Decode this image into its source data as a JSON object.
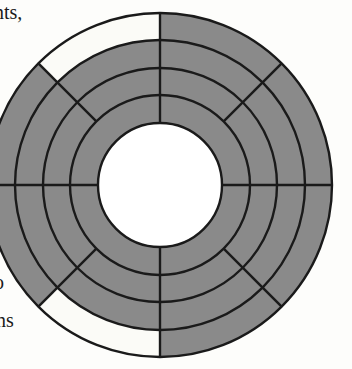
{
  "figure": {
    "name": "radial-sector-diagram",
    "canvas": {
      "width": 352,
      "height": 369
    },
    "colors": {
      "fill_gray": "#8a8a8a",
      "fill_empty": "#fbfbf7",
      "stroke": "#1a1a1a",
      "page_background": "#fdfdfb",
      "text": "#1a1a1a"
    },
    "geometry": {
      "center_x": 160,
      "center_y": 185,
      "outer_radius": 172,
      "hub_radius": 62,
      "ring_count": 4,
      "ring_radii": [
        62,
        90,
        117,
        145,
        172
      ],
      "stroke_width": 2.4,
      "spoke_angles_deg": [
        0,
        45,
        90,
        135,
        180,
        225,
        270,
        315
      ],
      "full_spoke_angles_deg": [
        0,
        90,
        180,
        270
      ],
      "outer_spoke_angles_deg": [
        45,
        135,
        225,
        315
      ]
    },
    "sectors": [
      {
        "id": "r4-s90-135",
        "ring": 4,
        "start_deg": 90,
        "end_deg": 135,
        "filled": false,
        "label": "outer upper-left"
      },
      {
        "id": "r4-s135-180",
        "ring": 4,
        "start_deg": 135,
        "end_deg": 180,
        "filled": true,
        "label": "outer left-upper"
      },
      {
        "id": "r4-s180-225",
        "ring": 4,
        "start_deg": 180,
        "end_deg": 225,
        "filled": true,
        "label": "outer left-lower"
      },
      {
        "id": "r4-s225-270",
        "ring": 4,
        "start_deg": 225,
        "end_deg": 270,
        "filled": false,
        "label": "outer lower-left"
      },
      {
        "id": "r4-s270-315",
        "ring": 4,
        "start_deg": 270,
        "end_deg": 315,
        "filled": true,
        "label": "outer lower-right"
      },
      {
        "id": "r4-s315-360",
        "ring": 4,
        "start_deg": 315,
        "end_deg": 360,
        "filled": true,
        "label": "outer right-lower"
      },
      {
        "id": "r4-s0-45",
        "ring": 4,
        "start_deg": 0,
        "end_deg": 45,
        "filled": true,
        "label": "outer right-upper"
      },
      {
        "id": "r4-s45-90",
        "ring": 4,
        "start_deg": 45,
        "end_deg": 90,
        "filled": true,
        "label": "outer upper-right"
      },
      {
        "id": "r3-all",
        "ring": 3,
        "start_deg": 0,
        "end_deg": 360,
        "filled": true,
        "label": "third ring"
      },
      {
        "id": "r2-all",
        "ring": 2,
        "start_deg": 0,
        "end_deg": 360,
        "filled": true,
        "label": "second ring"
      },
      {
        "id": "r1-all",
        "ring": 1,
        "start_deg": 0,
        "end_deg": 360,
        "filled": true,
        "label": "inner ring"
      },
      {
        "id": "hub",
        "ring": 0,
        "start_deg": 0,
        "end_deg": 360,
        "filled": false,
        "label": "central hub"
      }
    ],
    "page_text_fragments": [
      {
        "id": "frag-top",
        "text": "nts,"
      },
      {
        "id": "frag-lower",
        "text": "o"
      },
      {
        "id": "frag-lower-below",
        "text": "ns"
      }
    ]
  }
}
